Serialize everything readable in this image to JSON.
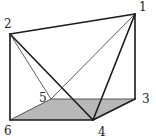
{
  "diagram": {
    "type": "triangular-prism",
    "base_fill": "#b8b8b8",
    "stroke": "#1a1a1a",
    "vertices": [
      {
        "id": "1",
        "x": 135,
        "y": 14,
        "label": "1",
        "lx": 139,
        "ly": 11
      },
      {
        "id": "2",
        "x": 10,
        "y": 34,
        "label": "2",
        "lx": 4,
        "ly": 28
      },
      {
        "id": "3",
        "x": 135,
        "y": 99,
        "label": "3",
        "lx": 142,
        "ly": 103
      },
      {
        "id": "4",
        "x": 93,
        "y": 120,
        "label": "4",
        "lx": 98,
        "ly": 136
      },
      {
        "id": "5",
        "x": 51,
        "y": 99,
        "label": "5",
        "lx": 39,
        "ly": 102
      },
      {
        "id": "6",
        "x": 10,
        "y": 120,
        "label": "6",
        "lx": 4,
        "ly": 135
      }
    ]
  }
}
